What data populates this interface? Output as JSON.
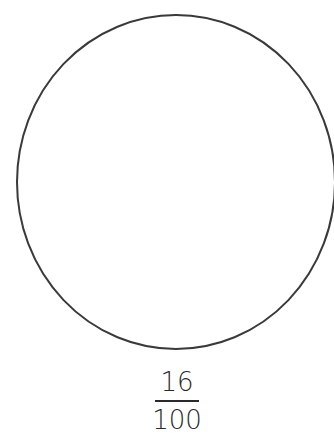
{
  "figure": {
    "shape": {
      "type": "circle",
      "stroke_color": "#3a3a3a",
      "fill_color": "#ffffff"
    },
    "fraction": {
      "numerator": "16",
      "denominator": "100"
    }
  }
}
